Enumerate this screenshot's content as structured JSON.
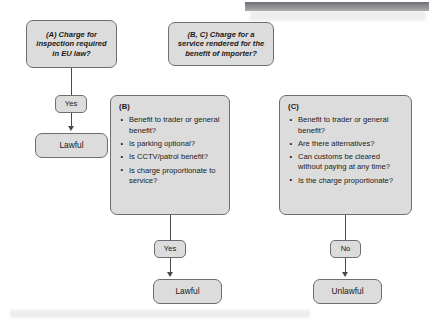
{
  "diagram": {
    "colors": {
      "node_fill": "#dcdcdc",
      "node_border": "#6e6e6e",
      "connector": "#4a4a4a",
      "text": "#1a1a1a",
      "background": "#ffffff",
      "top_bar": "#8a8c90"
    },
    "branch_a": {
      "question": "(A) Charge for inspection required in EU law?",
      "edge_label": "Yes",
      "outcome": "Lawful"
    },
    "branch_bc": {
      "question": "(B, C) Charge for a service rendered for the benefit of importer?"
    },
    "branch_b": {
      "title": "(B)",
      "criteria": [
        "Benefit to trader or general benefit?",
        "Is parking optional?",
        "Is CCTV/patrol benefit?",
        "Is charge proportionate to service?"
      ],
      "edge_label": "Yes",
      "outcome": "Lawful"
    },
    "branch_c": {
      "title": "(C)",
      "criteria": [
        "Benefit to trader or general benefit?",
        "Are there alternatives?",
        "Can customs be cleared without paying at any time?",
        "Is the charge proportionate?"
      ],
      "edge_label": "No",
      "outcome": "Unlawful"
    }
  }
}
